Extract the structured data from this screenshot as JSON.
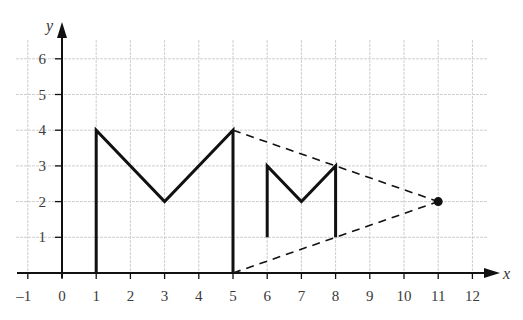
{
  "chart_data": {
    "type": "line",
    "title": "",
    "xlabel": "x",
    "ylabel": "y",
    "xlim": [
      -1.3,
      12.5
    ],
    "ylim": [
      0,
      6.5
    ],
    "grid": true,
    "x_ticks": [
      -1,
      0,
      1,
      2,
      3,
      4,
      5,
      6,
      7,
      8,
      9,
      10,
      11,
      12
    ],
    "x_tick_labels": [
      "–1",
      "0",
      "1",
      "2",
      "3",
      "4",
      "5",
      "6",
      "7",
      "8",
      "9",
      "10",
      "11",
      "12"
    ],
    "y_ticks": [
      1,
      2,
      3,
      4,
      5,
      6
    ],
    "y_tick_labels": [
      "1",
      "2",
      "3",
      "4",
      "5",
      "6"
    ],
    "series": [
      {
        "name": "large-M",
        "style": "solid",
        "points": [
          [
            1,
            0
          ],
          [
            1,
            4
          ],
          [
            3,
            2
          ],
          [
            5,
            4
          ],
          [
            5,
            0
          ]
        ]
      },
      {
        "name": "small-M",
        "style": "solid",
        "points": [
          [
            6,
            1
          ],
          [
            6,
            3
          ],
          [
            7,
            2
          ],
          [
            8,
            3
          ],
          [
            8,
            1
          ]
        ]
      },
      {
        "name": "projection-line-top",
        "style": "dashed",
        "points": [
          [
            5,
            4
          ],
          [
            11,
            2
          ]
        ]
      },
      {
        "name": "projection-line-bottom",
        "style": "dashed",
        "points": [
          [
            5,
            0
          ],
          [
            11,
            2
          ]
        ]
      }
    ],
    "annotations": [
      {
        "type": "point",
        "label": "centre of enlargement",
        "x": 11,
        "y": 2
      }
    ]
  },
  "colors": {
    "ink": "#111111",
    "grid": "#cfcfcf",
    "tick_text": "#3a3a3a"
  }
}
